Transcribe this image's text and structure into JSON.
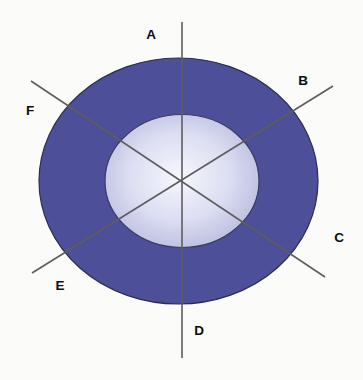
{
  "diagram": {
    "labels": [
      "A",
      "B",
      "C",
      "D",
      "E",
      "F"
    ],
    "colors": {
      "background": "#fbfbf9",
      "outer_ring": "#4d4f99",
      "outer_ring_outline": "#2d2d52",
      "inner_outline": "#3c3c66",
      "inner_center": "#f6f7fd",
      "inner_mid": "#dcdef2",
      "inner_edge": "#a6a8d4",
      "axis_line": "#5d5d60",
      "label_color": "#0d0d0d"
    }
  }
}
